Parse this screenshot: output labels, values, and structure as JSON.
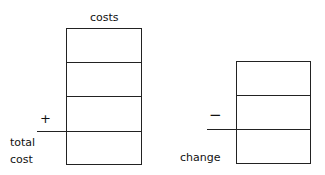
{
  "left_column": {
    "header": "costs",
    "rows": 4,
    "operator": "+",
    "result_label_line1": "total",
    "result_label_line2": "cost"
  },
  "right_column": {
    "rows": 3,
    "operator": "−",
    "result_label": "change"
  }
}
